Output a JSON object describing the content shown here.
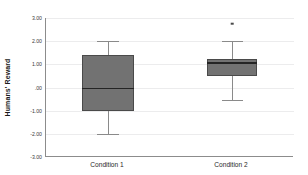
{
  "chart_data": {
    "type": "box",
    "title": "",
    "xlabel": "",
    "ylabel": "Humans' Reward",
    "categories": [
      "Condition 1",
      "Condition 2"
    ],
    "ylim": [
      -3.0,
      3.0
    ],
    "ytick_values": [
      3.0,
      2.0,
      1.0,
      0.0,
      -1.0,
      -2.0,
      -3.0
    ],
    "ytick_labels": [
      "3.00",
      "2.00",
      "1.00",
      ".00",
      "-1.00",
      "-2.00",
      "-3.00"
    ],
    "grid": true,
    "legend": "none",
    "boxes": [
      {
        "category": "Condition 1",
        "whisker_low": -2.0,
        "q1": -1.0,
        "median": -0.05,
        "q3": 1.4,
        "whisker_high": 2.0,
        "outliers": []
      },
      {
        "category": "Condition 2",
        "whisker_low": -0.55,
        "q1": 0.5,
        "median": 1.05,
        "q3": 1.25,
        "whisker_high": 2.0,
        "outliers": [
          2.75
        ]
      }
    ],
    "colors": {
      "box_fill": "#727272",
      "box_border": "#4a4a4a",
      "median": "#242424",
      "whisker": "#8a8a8a",
      "outlier": "#4a4a4a",
      "gridline": "#ececed",
      "axis": "#8c8c8c"
    }
  }
}
